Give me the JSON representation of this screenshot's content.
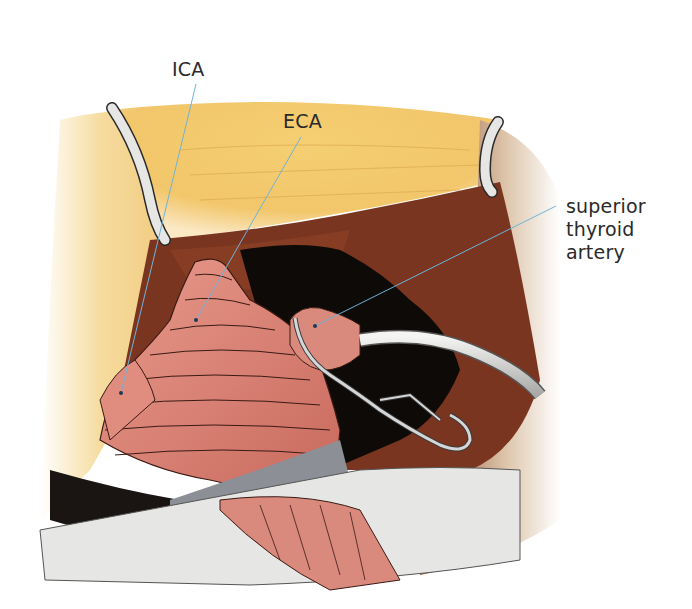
{
  "figure": {
    "type": "surgical-illustration",
    "labels": [
      {
        "id": "ica",
        "text": "ICA",
        "anchor_text": [
          172,
          60
        ],
        "leader_from": [
          196,
          84
        ],
        "leader_to": [
          121,
          393
        ]
      },
      {
        "id": "eca",
        "text": "ECA",
        "anchor_text": [
          283,
          112
        ],
        "leader_from": [
          301,
          137
        ],
        "leader_to": [
          196,
          320
        ]
      },
      {
        "id": "sta",
        "lines": [
          "superior",
          "thyroid",
          "artery"
        ],
        "anchor_text": [
          566,
          195
        ],
        "leader_from": [
          556,
          206
        ],
        "leader_to": [
          315,
          326
        ]
      }
    ],
    "colors": {
      "fat": "#f2c66a",
      "muscle": "#7a3520",
      "artery": "#dc8578",
      "artery_line": "#3a1a14",
      "cavity": "#0d0a08",
      "retractor": "#e6e6e4",
      "drape": "#8c8f96",
      "leader": "#6fb3d9"
    }
  }
}
